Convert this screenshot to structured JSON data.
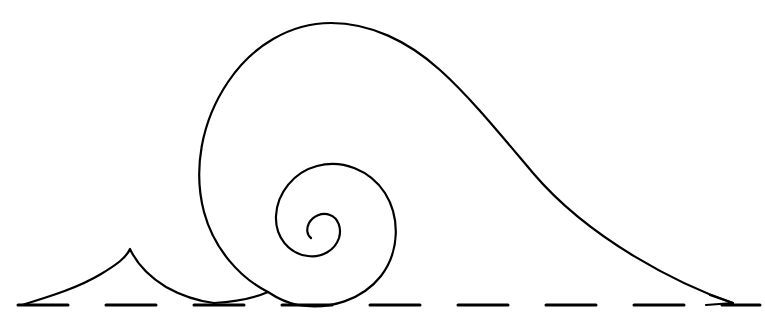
{
  "artwork": {
    "title": "Breaking Wave Line Drawing",
    "subject": "stylized ocean wave with curling spiral crest, small peak and dashed shoreline",
    "canvas": {
      "width": 765,
      "height": 332,
      "background_color": "#ffffff"
    },
    "style": {
      "ink_color": "#000000",
      "stroke_width": 2,
      "fill": "none",
      "line_cap": "round",
      "technique": "single-weight contour line art"
    },
    "elements": [
      {
        "name": "wave-curl",
        "label": "Large breaking wave with inward spiral",
        "description": "Long sweeping crest rising from the left shoreline, arcing over the top and descending in a long straight slope to the right, with the leading edge curling into a tight inward spiral."
      },
      {
        "name": "small-peak",
        "label": "Small foreground peak",
        "description": "Low concave-sided triangular peak on the left, tip pointing upward, sides sweeping down to the shoreline."
      },
      {
        "name": "baseline",
        "label": "Dashed shoreline / water level",
        "description": "Horizontal dashed rule running the full width beneath the wave."
      }
    ],
    "geometry": {
      "wave_outer_path": "M 293 306 C 250 304 210 268 199 205 C 189 140 214 76 265 42 C 315 9 380 14 432 46 C 500 88 640 220 733 303",
      "wave_inner_spiral_path": "M 733 303 L 293 306 C 267 303 256 288 256 268 C 256 228 282 180 318 168 C 360 155 394 184 394 222 C 394 256 368 278 340 278 C 316 278 297 261 297 240 C 297 228 303 219 311 214",
      "small_peak_path": "M 22 305 C 62 292 106 276 130 249 C 152 272 182 292 215 300",
      "baseline_y": 305,
      "baseline_dash": {
        "dash_length": 50,
        "gap_length": 38,
        "start_x": 18,
        "end_x": 760
      },
      "wave_crest_apex": {
        "x": 340,
        "y": 25
      },
      "wave_left_extent": {
        "x": 198,
        "y": 178
      },
      "wave_right_tip": {
        "x": 733,
        "y": 303
      },
      "spiral_center": {
        "x": 328,
        "y": 218
      },
      "spiral_inner_terminus": {
        "x": 298,
        "y": 233
      },
      "small_peak_apex": {
        "x": 130,
        "y": 249
      },
      "small_peak_left_tip": {
        "x": 22,
        "y": 305
      }
    }
  }
}
